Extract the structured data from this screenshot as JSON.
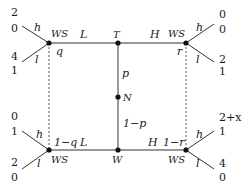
{
  "diagram": {
    "type": "game-tree",
    "nodes": {
      "T": {
        "label": "T"
      },
      "N": {
        "label": "N"
      },
      "W": {
        "label": "W"
      },
      "WS_top_left": {
        "label": "WS",
        "belief": "q"
      },
      "WS_top_right": {
        "label": "WS",
        "belief": "r"
      },
      "WS_bottom_left": {
        "label": "WS",
        "belief": "1−q"
      },
      "WS_bottom_right": {
        "label": "WS",
        "belief": "1−r"
      }
    },
    "edges": {
      "T_left": "L",
      "T_right": "H",
      "W_left": "L",
      "W_right": "H",
      "N_up": "p",
      "N_down": "1−p"
    },
    "actions": {
      "high": "h",
      "low": "l"
    },
    "payoffs": {
      "top_left_h": [
        "2",
        "0"
      ],
      "top_left_l": [
        "4",
        "1"
      ],
      "top_right_h": [
        "0",
        "0"
      ],
      "top_right_l": [
        "2",
        "1"
      ],
      "bottom_left_h": [
        "0",
        "1"
      ],
      "bottom_left_l": [
        "2",
        "0"
      ],
      "bottom_right_h": [
        "2+x",
        "1"
      ],
      "bottom_right_l": [
        "4",
        "0"
      ]
    }
  }
}
